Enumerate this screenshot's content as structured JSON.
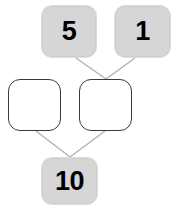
{
  "diagram": {
    "type": "number-bond",
    "background_color": "#ffffff",
    "nodes": [
      {
        "id": "addend-5",
        "label": "5",
        "style": "filled",
        "fill_color": "#d6d6d6",
        "text_color": "#000000",
        "row": "top",
        "position": "left"
      },
      {
        "id": "addend-1",
        "label": "1",
        "style": "filled",
        "fill_color": "#d6d6d6",
        "text_color": "#000000",
        "row": "top",
        "position": "right"
      },
      {
        "id": "blank-left",
        "label": "",
        "style": "empty",
        "fill_color": "#ffffff",
        "border_color": "#3a3a3a",
        "row": "middle",
        "position": "left"
      },
      {
        "id": "blank-right",
        "label": "",
        "style": "empty",
        "fill_color": "#ffffff",
        "border_color": "#3a3a3a",
        "row": "middle",
        "position": "right"
      },
      {
        "id": "total-10",
        "label": "10",
        "style": "filled",
        "fill_color": "#d6d6d6",
        "text_color": "#000000",
        "row": "bottom",
        "position": "center"
      }
    ],
    "edges": [
      {
        "id": "edge-5-to-blank-right",
        "from": "addend-5",
        "to": "blank-right",
        "color": "#b0b0b0"
      },
      {
        "id": "edge-1-to-blank-right",
        "from": "addend-1",
        "to": "blank-right",
        "color": "#b0b0b0"
      },
      {
        "id": "edge-blank-left-to-total",
        "from": "blank-left",
        "to": "total-10",
        "color": "#b0b0b0"
      },
      {
        "id": "edge-blank-right-to-total",
        "from": "blank-right",
        "to": "total-10",
        "color": "#b0b0b0"
      }
    ]
  }
}
